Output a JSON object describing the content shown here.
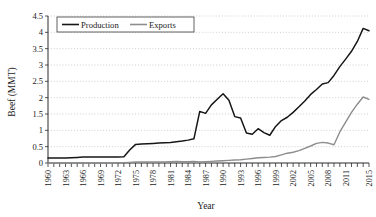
{
  "chart_data": {
    "type": "line",
    "title": "",
    "xlabel": "Year",
    "ylabel": "Beef (MMT)",
    "xlim": [
      1960,
      2015
    ],
    "ylim": [
      0,
      4.5
    ],
    "ytick_labels": [
      "0",
      "0.5",
      "1",
      "1.5",
      "2",
      "2.5",
      "3",
      "3.5",
      "4",
      "4.5"
    ],
    "ytick_values": [
      0,
      0.5,
      1,
      1.5,
      2,
      2.5,
      3,
      3.5,
      4,
      4.5
    ],
    "xtick_labels": [
      "1960",
      "1963",
      "1966",
      "1969",
      "1972",
      "1975",
      "1978",
      "1981",
      "1984",
      "1987",
      "1990",
      "1993",
      "1996",
      "1999",
      "2002",
      "2005",
      "2008",
      "2011",
      "2015"
    ],
    "xtick_values": [
      1960,
      1963,
      1966,
      1969,
      1972,
      1975,
      1978,
      1981,
      1984,
      1987,
      1990,
      1993,
      1996,
      1999,
      2002,
      2005,
      2008,
      2011,
      2015
    ],
    "grid": "horizontal-dotted",
    "legend_position": "top-left-inside",
    "x": [
      1960,
      1961,
      1962,
      1963,
      1964,
      1965,
      1966,
      1967,
      1968,
      1969,
      1970,
      1971,
      1972,
      1973,
      1974,
      1975,
      1976,
      1977,
      1978,
      1979,
      1980,
      1981,
      1982,
      1983,
      1984,
      1985,
      1986,
      1987,
      1988,
      1989,
      1990,
      1991,
      1992,
      1993,
      1994,
      1995,
      1996,
      1997,
      1998,
      1999,
      2000,
      2001,
      2002,
      2003,
      2004,
      2005,
      2006,
      2007,
      2008,
      2009,
      2010,
      2011,
      2012,
      2013,
      2014,
      2015
    ],
    "series": [
      {
        "name": "Production",
        "color": "#161616",
        "values": [
          0.15,
          0.15,
          0.15,
          0.15,
          0.16,
          0.17,
          0.18,
          0.18,
          0.18,
          0.18,
          0.18,
          0.18,
          0.18,
          0.19,
          0.4,
          0.57,
          0.58,
          0.59,
          0.6,
          0.61,
          0.62,
          0.63,
          0.65,
          0.67,
          0.7,
          0.74,
          1.58,
          1.52,
          1.78,
          1.95,
          2.12,
          1.92,
          1.42,
          1.38,
          0.92,
          0.88,
          1.05,
          0.93,
          0.85,
          1.12,
          1.3,
          1.4,
          1.55,
          1.72,
          1.9,
          2.1,
          2.25,
          2.42,
          2.46,
          2.68,
          2.95,
          3.18,
          3.42,
          3.72,
          4.12,
          4.05
        ]
      },
      {
        "name": "Exports",
        "color": "#8d8d8d",
        "values": [
          0.0,
          0.0,
          0.0,
          0.0,
          0.0,
          0.0,
          0.0,
          0.0,
          0.0,
          0.0,
          0.0,
          0.0,
          0.01,
          0.01,
          0.02,
          0.03,
          0.03,
          0.03,
          0.03,
          0.03,
          0.03,
          0.04,
          0.05,
          0.04,
          0.04,
          0.05,
          0.03,
          0.04,
          0.05,
          0.06,
          0.07,
          0.08,
          0.09,
          0.1,
          0.12,
          0.14,
          0.16,
          0.17,
          0.18,
          0.2,
          0.25,
          0.3,
          0.33,
          0.38,
          0.45,
          0.52,
          0.6,
          0.63,
          0.61,
          0.56,
          0.95,
          1.25,
          1.55,
          1.8,
          2.02,
          1.95
        ]
      }
    ]
  },
  "legend": {
    "items": [
      {
        "label": "Production"
      },
      {
        "label": "Exports"
      }
    ]
  },
  "axes": {
    "y_title": "Beef (MMT)",
    "x_title": "Year"
  }
}
